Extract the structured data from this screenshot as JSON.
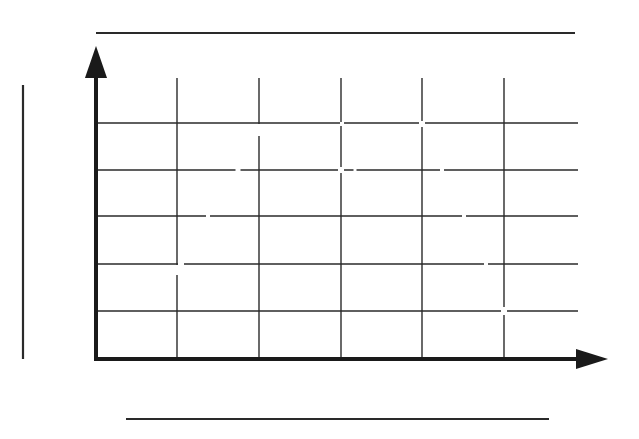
{
  "diagram": {
    "type": "blank-coordinate-grid",
    "canvas": {
      "width": 639,
      "height": 439,
      "background": "#ffffff"
    },
    "colors": {
      "grid": "#2a2a2a",
      "axis": "#1a1a1a",
      "bars": "#2a2a2a"
    },
    "origin": {
      "x": 96,
      "y": 359
    },
    "y_axis": {
      "x": 96,
      "y_bottom": 361,
      "y_top": 78,
      "arrow_tip_y": 46,
      "arrow_half_width": 16,
      "label": ""
    },
    "x_axis": {
      "y": 359,
      "x_left": 94,
      "x_right": 578,
      "arrow_tip_x": 608,
      "arrow_half_height": 10,
      "label": ""
    },
    "vertical_gridlines": {
      "x": [
        177,
        259,
        341,
        422,
        504
      ],
      "y_top": 78,
      "y_bottom": 359
    },
    "horizontal_gridlines": {
      "y": [
        123,
        170,
        216,
        264,
        311
      ],
      "x_left": 96,
      "x_right": 578
    },
    "gridline_breaks": [
      {
        "x": 259,
        "y": 130,
        "w": 4,
        "h": 12
      },
      {
        "x": 238,
        "y": 170,
        "w": 5,
        "h": 4
      },
      {
        "x": 341,
        "y": 170,
        "w": 6,
        "h": 6
      },
      {
        "x": 422,
        "y": 124,
        "w": 6,
        "h": 6
      },
      {
        "x": 342,
        "y": 124,
        "w": 4,
        "h": 4
      },
      {
        "x": 355,
        "y": 170,
        "w": 3,
        "h": 4
      },
      {
        "x": 208,
        "y": 216,
        "w": 4,
        "h": 4
      },
      {
        "x": 442,
        "y": 170,
        "w": 4,
        "h": 4
      },
      {
        "x": 464,
        "y": 216,
        "w": 4,
        "h": 4
      },
      {
        "x": 181,
        "y": 264,
        "w": 6,
        "h": 4
      },
      {
        "x": 177,
        "y": 270,
        "w": 4,
        "h": 10
      },
      {
        "x": 486,
        "y": 264,
        "w": 4,
        "h": 4
      },
      {
        "x": 504,
        "y": 311,
        "w": 6,
        "h": 8
      }
    ],
    "bars": {
      "top": {
        "x1": 96,
        "x2": 575,
        "y": 33
      },
      "bottom": {
        "x1": 126,
        "x2": 549,
        "y": 419
      },
      "left": {
        "x": 23,
        "y1": 85,
        "y2": 359
      }
    }
  }
}
